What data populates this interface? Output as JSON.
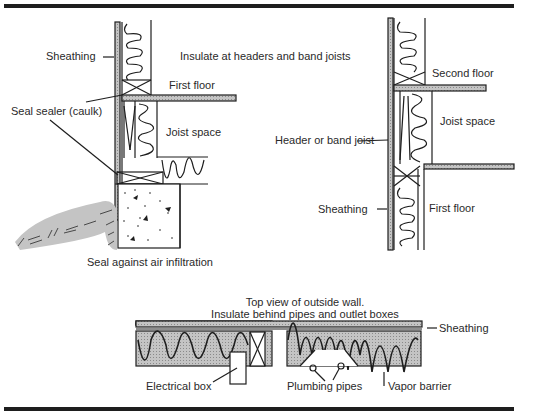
{
  "figure": {
    "type": "building insulation cross-section diagram",
    "panels": [
      {
        "id": "left-section",
        "title": "Insulate at headers and band joists",
        "labels": {
          "sheathing": "Sheathing",
          "first_floor": "First floor",
          "seal_sealer": "Seal sealer (caulk)",
          "joist_space": "Joist space",
          "seal_air": "Seal against air infiltration"
        }
      },
      {
        "id": "right-section",
        "labels": {
          "second_floor": "Second floor",
          "joist_space": "Joist space",
          "header": "Header or band joist",
          "sheathing": "Sheathing",
          "first_floor": "First floor"
        }
      },
      {
        "id": "top-view",
        "title_line1": "Top view of outside wall.",
        "title_line2": "Insulate behind pipes and outlet boxes",
        "labels": {
          "sheathing": "Sheathing",
          "electrical_box": "Electrical box",
          "plumbing_pipes": "Plumbing pipes",
          "vapor_barrier": "Vapor barrier"
        }
      }
    ],
    "colors": {
      "line": "#1e1e1e",
      "hatch_fill": "#b8b8b8",
      "background": "#ffffff"
    }
  }
}
